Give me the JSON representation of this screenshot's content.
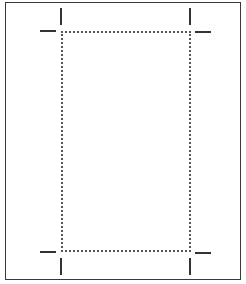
{
  "diagram": {
    "type": "print-layout-crop-marks",
    "page_border_color": "#3a3a3a",
    "trim_border_style": "dotted",
    "trim_border_color": "#555555",
    "crop_mark_color": "#333333",
    "crop_marks": [
      "top-left",
      "top-right",
      "bottom-left",
      "bottom-right"
    ]
  }
}
